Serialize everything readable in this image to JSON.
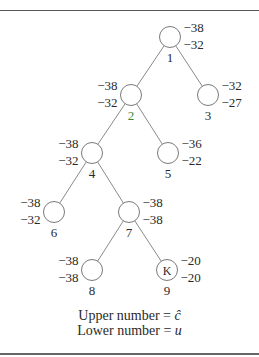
{
  "diagram": {
    "type": "branch-and-bound-tree",
    "nodes": [
      {
        "id": "1",
        "label": "1",
        "upper": "−38",
        "lower": "−32",
        "cx": 170,
        "cy": 37,
        "values_side": "right",
        "label_color": "#2a2a2a",
        "marker": ""
      },
      {
        "id": "2",
        "label": "2",
        "upper": "−38",
        "lower": "−32",
        "cx": 131,
        "cy": 95,
        "values_side": "left",
        "label_color": "#3a8a3a",
        "marker": ""
      },
      {
        "id": "3",
        "label": "3",
        "upper": "−32",
        "lower": "−27",
        "cx": 208,
        "cy": 95,
        "values_side": "right",
        "label_color": "#2a2a2a",
        "marker": ""
      },
      {
        "id": "4",
        "label": "4",
        "upper": "−38",
        "lower": "−32",
        "cx": 92,
        "cy": 153,
        "values_side": "left",
        "label_color": "#2a2a2a",
        "marker": ""
      },
      {
        "id": "5",
        "label": "5",
        "upper": "−36",
        "lower": "−22",
        "cx": 168,
        "cy": 153,
        "values_side": "right",
        "label_color": "#2a2a2a",
        "marker": ""
      },
      {
        "id": "6",
        "label": "6",
        "upper": "−38",
        "lower": "−32",
        "cx": 54,
        "cy": 212,
        "values_side": "left",
        "label_color": "#2a2a2a",
        "marker": ""
      },
      {
        "id": "7",
        "label": "7",
        "upper": "−38",
        "lower": "−38",
        "cx": 129,
        "cy": 212,
        "values_side": "right",
        "label_color": "#2a2a2a",
        "marker": ""
      },
      {
        "id": "8",
        "label": "8",
        "upper": "−38",
        "lower": "−38",
        "cx": 92,
        "cy": 270,
        "values_side": "left",
        "label_color": "#2a2a2a",
        "marker": ""
      },
      {
        "id": "9",
        "label": "9",
        "upper": "−20",
        "lower": "−20",
        "cx": 167,
        "cy": 270,
        "values_side": "right",
        "label_color": "#2a2a2a",
        "marker": "K"
      }
    ],
    "edges": [
      {
        "from": "1",
        "to": "2"
      },
      {
        "from": "1",
        "to": "3"
      },
      {
        "from": "2",
        "to": "4"
      },
      {
        "from": "2",
        "to": "5"
      },
      {
        "from": "4",
        "to": "6"
      },
      {
        "from": "4",
        "to": "7"
      },
      {
        "from": "7",
        "to": "8"
      },
      {
        "from": "7",
        "to": "9"
      }
    ]
  },
  "legend": {
    "upper_text": "Upper number = ",
    "upper_symbol": "ĉ",
    "lower_text": "Lower number = ",
    "lower_symbol": "u"
  }
}
